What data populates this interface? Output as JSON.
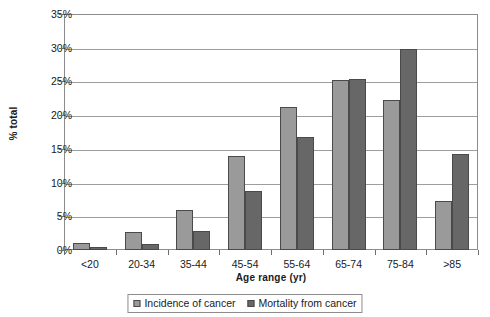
{
  "chart_data": {
    "type": "bar",
    "title": "",
    "xlabel": "Age range (yr)",
    "ylabel": "% total",
    "categories": [
      "<20",
      "20-34",
      "35-44",
      "45-54",
      "55-64",
      "65-74",
      "75-84",
      ">85"
    ],
    "series": [
      {
        "name": "Incidence of cancer",
        "color": "#9a9a9a",
        "values": [
          1.1,
          2.7,
          5.9,
          13.9,
          21.2,
          25.2,
          22.3,
          7.2
        ]
      },
      {
        "name": "Mortality from cancer",
        "color": "#676767",
        "values": [
          0.4,
          0.9,
          2.8,
          8.8,
          16.8,
          25.4,
          29.8,
          14.2
        ]
      }
    ],
    "ylim": [
      0,
      35
    ],
    "ytick_values": [
      0,
      5,
      10,
      15,
      20,
      25,
      30,
      35
    ],
    "ytick_labels": [
      "0%",
      "5%",
      "10%",
      "15%",
      "20%",
      "25%",
      "30%",
      "35%"
    ],
    "grid": true,
    "legend_position": "bottom"
  }
}
